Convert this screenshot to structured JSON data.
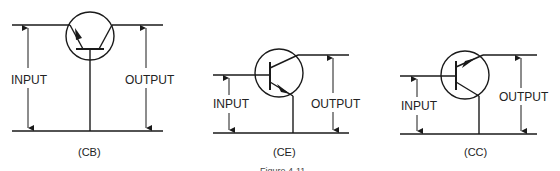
{
  "figure": {
    "caption": "Figure 4-11"
  },
  "circuits": [
    {
      "id": "cb",
      "caption": "(CB)",
      "input_label": "INPUT",
      "output_label": "OUTPUT",
      "configuration": "common-base"
    },
    {
      "id": "ce",
      "caption": "(CE)",
      "input_label": "INPUT",
      "output_label": "OUTPUT",
      "configuration": "common-emitter"
    },
    {
      "id": "cc",
      "caption": "(CC)",
      "input_label": "INPUT",
      "output_label": "OUTPUT",
      "configuration": "common-collector"
    }
  ],
  "colors": {
    "stroke": "#1a1a1a",
    "background": "#ffffff"
  }
}
